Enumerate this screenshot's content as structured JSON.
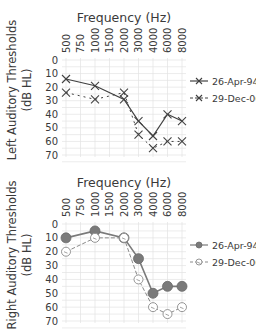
{
  "chart_data": [
    {
      "type": "line",
      "title": "Frequency (Hz)",
      "xlabel": "Frequency (Hz)",
      "ylabel": "Left Auditory Thresholds (dB HL)",
      "categories": [
        "500",
        "750",
        "1000",
        "1500",
        "2000",
        "3000",
        "4000",
        "6000",
        "8000"
      ],
      "yticks": [
        "0",
        "10",
        "20",
        "30",
        "40",
        "50",
        "60",
        "70"
      ],
      "ylim": [
        0,
        70
      ],
      "y_inverted": true,
      "grid": true,
      "legend_position": "right",
      "series": [
        {
          "name": "26-Apr-94",
          "marker": "x-bar",
          "style": "solid",
          "color": "#404040",
          "values": [
            14,
            null,
            19,
            null,
            29,
            45,
            56,
            40,
            45
          ]
        },
        {
          "name": "29-Dec-06",
          "marker": "x",
          "style": "dashed",
          "color": "#404040",
          "values": [
            24,
            null,
            29,
            null,
            24,
            55,
            65,
            60,
            60
          ]
        }
      ]
    },
    {
      "type": "line",
      "title": "Frequency (Hz)",
      "xlabel": "Frequency (Hz)",
      "ylabel": "Right Auditory Thresholds (dB HL)",
      "categories": [
        "500",
        "750",
        "1000",
        "1500",
        "2000",
        "3000",
        "4000",
        "6000",
        "8000"
      ],
      "yticks": [
        "0",
        "10",
        "20",
        "30",
        "40",
        "50",
        "60",
        "70"
      ],
      "ylim": [
        0,
        70
      ],
      "y_inverted": true,
      "grid": true,
      "legend_position": "right",
      "series": [
        {
          "name": "26-Apr-94",
          "marker": "filled-circle",
          "style": "solid",
          "color": "#7a7a7a",
          "values": [
            10,
            null,
            5,
            null,
            10,
            25,
            50,
            45,
            45
          ]
        },
        {
          "name": "29-Dec-06",
          "marker": "open-circle",
          "style": "dashed",
          "color": "#8a8a8a",
          "values": [
            20,
            null,
            10,
            null,
            10,
            40,
            60,
            65,
            60
          ]
        }
      ]
    }
  ],
  "top": {
    "title": "Frequency (Hz)",
    "ylabel_line1": "Left Auditory Thresholds",
    "ylabel_line2": "(dB HL)",
    "legend": [
      "26-Apr-94",
      "29-Dec-06"
    ]
  },
  "bottom": {
    "title": "Frequency (Hz)",
    "ylabel_line1": "Right Auditory Thresholds",
    "ylabel_line2": "(dB HL)",
    "legend": [
      "26-Apr-94",
      "29-Dec-06"
    ]
  }
}
